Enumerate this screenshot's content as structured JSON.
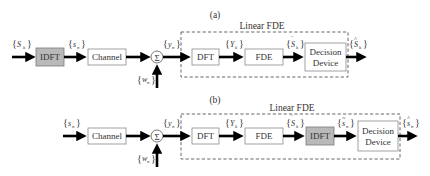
{
  "diagrams": [
    {
      "label": "(a)",
      "group_label": "Linear FDE",
      "blocks": {
        "idft": "IDFT",
        "channel": "Channel",
        "sum": "Σ",
        "dft": "DFT",
        "fde": "FDE",
        "decision_line1": "Decision",
        "decision_line2": "Device"
      },
      "signals": {
        "input": {
          "sym": "S",
          "sub": "k",
          "accent": ""
        },
        "after_idft": {
          "sym": "s",
          "sub": "n",
          "accent": ""
        },
        "noise": {
          "sym": "w",
          "sub": "n",
          "accent": ""
        },
        "received": {
          "sym": "y",
          "sub": "n",
          "accent": ""
        },
        "after_dft": {
          "sym": "Y",
          "sub": "k",
          "accent": ""
        },
        "after_fde": {
          "sym": "S",
          "sub": "k",
          "accent": "‾"
        },
        "output": {
          "sym": "S",
          "sub": "k",
          "accent": "^"
        }
      }
    },
    {
      "label": "(b)",
      "group_label": "Linear FDE",
      "blocks": {
        "channel": "Channel",
        "sum": "Σ",
        "dft": "DFT",
        "fde": "FDE",
        "idft": "IDFT",
        "decision_line1": "Decision",
        "decision_line2": "Device"
      },
      "signals": {
        "input": {
          "sym": "s",
          "sub": "n",
          "accent": ""
        },
        "noise": {
          "sym": "w",
          "sub": "n",
          "accent": ""
        },
        "received": {
          "sym": "y",
          "sub": "n",
          "accent": ""
        },
        "after_dft": {
          "sym": "Y",
          "sub": "k",
          "accent": ""
        },
        "after_fde": {
          "sym": "S",
          "sub": "k",
          "accent": "‾"
        },
        "after_idft": {
          "sym": "s",
          "sub": "n",
          "accent": "~"
        },
        "output": {
          "sym": "s",
          "sub": "n",
          "accent": "^"
        }
      }
    }
  ],
  "colors": {
    "gray_block": "#b9b9b9",
    "arrow": "#000000",
    "border": "#8a8a8a"
  }
}
